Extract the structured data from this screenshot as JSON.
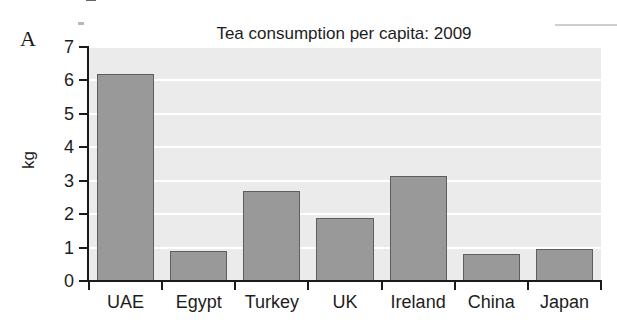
{
  "figure": {
    "panel_label": "A",
    "width": 617,
    "height": 326
  },
  "chart_data": {
    "type": "bar",
    "title": "Tea consumption per capita: 2009",
    "xlabel": "",
    "ylabel": "kg",
    "categories": [
      "UAE",
      "Egypt",
      "Turkey",
      "UK",
      "Ireland",
      "China",
      "Japan"
    ],
    "values": [
      6.2,
      0.9,
      2.7,
      1.9,
      3.15,
      0.8,
      0.95
    ],
    "ylim": [
      0,
      7
    ],
    "yticks": [
      0,
      1,
      2,
      3,
      4,
      5,
      6,
      7
    ],
    "ytick_labels": [
      "0",
      "1",
      "2",
      "3",
      "4",
      "5",
      "6",
      "7"
    ],
    "grid": "horizontal-white",
    "legend": "none",
    "colors": {
      "bar_fill": "#999999",
      "bar_edge": "#5e5e5e",
      "panel_background": "#ebebeb",
      "gridline": "#ffffff",
      "axis": "#1a1a1a",
      "text": "#1d1d1d",
      "page_background": "#ffffff"
    }
  }
}
